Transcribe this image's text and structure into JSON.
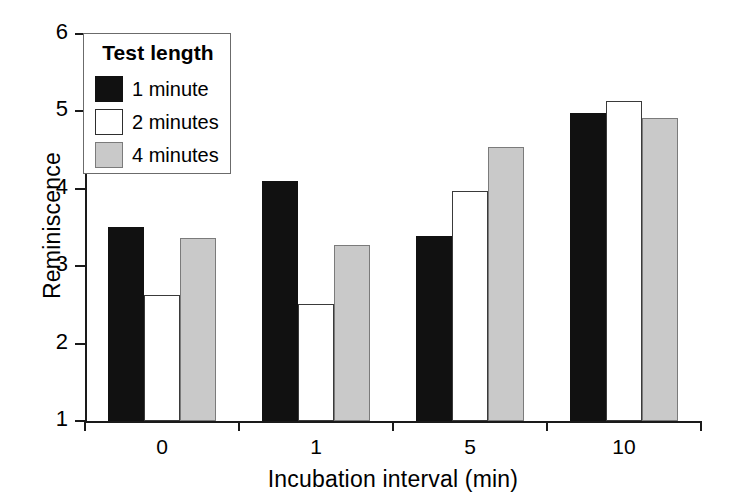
{
  "chart_data": {
    "type": "bar",
    "title": "",
    "xlabel": "Incubation interval (min)",
    "ylabel": "Reminiscence",
    "categories": [
      "0",
      "1",
      "5",
      "10"
    ],
    "series": [
      {
        "name": "1 minute",
        "color": "#111111",
        "values": [
          3.51,
          4.1,
          3.39,
          4.98
        ]
      },
      {
        "name": "2 minutes",
        "color": "#ffffff",
        "values": [
          2.63,
          2.51,
          3.97,
          5.14
        ]
      },
      {
        "name": "4 minutes",
        "color": "#c9c9c9",
        "values": [
          3.36,
          3.27,
          4.54,
          4.91
        ]
      }
    ],
    "ylim": [
      1,
      6
    ],
    "yticks": [
      1,
      2,
      3,
      4,
      5,
      6
    ],
    "ytick_labels": [
      "1",
      "2",
      "3",
      "4",
      "5",
      "6"
    ],
    "xtick_labels": [
      "0",
      "1",
      "5",
      "10"
    ],
    "grid": false,
    "legend_position": "upper-left",
    "legend_title": "Test length"
  },
  "axes": {
    "y_label": "Reminiscence",
    "x_label": "Incubation interval (min)"
  },
  "legend": {
    "title": "Test length",
    "entries": [
      {
        "label": "1 minute"
      },
      {
        "label": "2 minutes"
      },
      {
        "label": "4 minutes"
      }
    ]
  }
}
